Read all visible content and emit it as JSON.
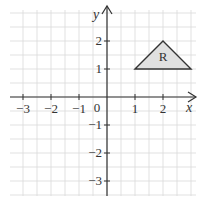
{
  "diagram": {
    "type": "coordinate-grid",
    "x_axis": {
      "label": "x",
      "ticks": [
        -3,
        -2,
        -1,
        1,
        2
      ],
      "tick_labels": [
        "−3",
        "−2",
        "−1",
        "1",
        "2"
      ],
      "range": [
        -3.5,
        3.2
      ]
    },
    "y_axis": {
      "label": "y",
      "ticks": [
        -3,
        -2,
        -1,
        1,
        2
      ],
      "tick_labels": [
        "−3",
        "−2",
        "−1",
        "1",
        "2"
      ],
      "range": [
        -3.5,
        3.2
      ]
    },
    "origin_label": "0",
    "shape": {
      "name": "R",
      "label": "R",
      "vertices": [
        [
          1,
          1
        ],
        [
          2,
          2
        ],
        [
          3,
          1
        ]
      ],
      "fill": "#e0e0e0",
      "stroke": "#333333"
    },
    "colors": {
      "grid": "#d9d9d9",
      "axis": "#333333"
    }
  }
}
